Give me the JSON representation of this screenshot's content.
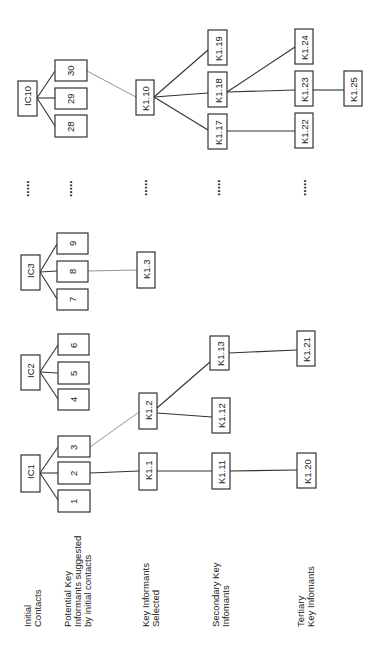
{
  "row_labels": {
    "initial_contacts": [
      "Initial",
      "Contacts"
    ],
    "potential": [
      "Potential Key",
      "Informants suggested",
      "by initial contacts"
    ],
    "key_selected": [
      "Key Informants",
      "Selected"
    ],
    "secondary": [
      "Secondary Key",
      "Infomants"
    ],
    "tertiary": [
      "Tertiary",
      "Key Infomants"
    ]
  },
  "initial_contacts": [
    {
      "id": "IC1",
      "children": [
        "1",
        "2",
        "3"
      ]
    },
    {
      "id": "IC2",
      "children": [
        "4",
        "5",
        "6"
      ]
    },
    {
      "id": "IC3",
      "children": [
        "7",
        "8",
        "9"
      ]
    },
    {
      "id": "IC10",
      "children": [
        "28",
        "29",
        "30"
      ]
    }
  ],
  "key_informants": {
    "k1_1": "K1.1",
    "k1_2": "K1.2",
    "k1_3": "K1.3",
    "k1_10": "K1.10",
    "k1_11": "K1.11",
    "k1_12": "K1.12",
    "k1_13": "K1.13",
    "k1_17": "K1.17",
    "k1_18": "K1.18",
    "k1_19": "K1.19",
    "k1_20": "K1.20",
    "k1_21": "K1.21",
    "k1_22": "K1.22",
    "k1_23": "K1.23",
    "k1_24": "K1.24",
    "k1_25": "K1.25"
  },
  "ellipsis": "....."
}
